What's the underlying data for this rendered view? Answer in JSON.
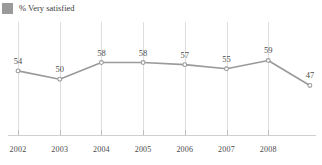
{
  "legend": {
    "swatch_color": "#9a9a9a",
    "label": "% Very satisfied",
    "icon": "square-swatch-icon"
  },
  "chart_data": {
    "type": "line",
    "title": "",
    "subtitle": "",
    "xlabel": "",
    "ylabel": "",
    "grid": "vertical",
    "legend_position": "top-left",
    "line_color": "#9a9a9a",
    "marker": "circle",
    "categories": [
      "2002",
      "2003",
      "2004",
      "2005",
      "2006",
      "2007",
      "2008",
      ""
    ],
    "tick_labels": [
      "2002",
      "2003",
      "2004",
      "2005",
      "2006",
      "2007",
      "2008"
    ],
    "values": [
      54,
      50,
      58,
      58,
      57,
      55,
      59,
      47
    ],
    "data_labels": [
      "54",
      "50",
      "58",
      "58",
      "57",
      "55",
      "59",
      "47"
    ],
    "series": [
      {
        "name": "% Very satisfied",
        "values": [
          54,
          50,
          58,
          58,
          57,
          55,
          59,
          47
        ]
      }
    ],
    "ylim": [
      40,
      65
    ],
    "xlim": [
      0,
      7
    ]
  }
}
